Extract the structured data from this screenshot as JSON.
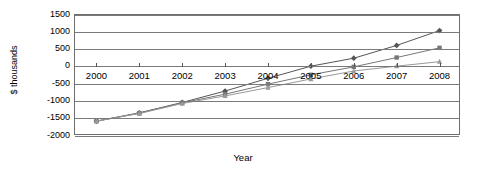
{
  "chart_data": {
    "type": "line",
    "title": "",
    "xlabel": "Year",
    "ylabel": "$ thousands",
    "categories": [
      "2000",
      "2001",
      "2002",
      "2003",
      "2004",
      "2005",
      "2006",
      "2007",
      "2008"
    ],
    "x": [
      2000,
      2001,
      2002,
      2003,
      2004,
      2005,
      2006,
      2007,
      2008
    ],
    "ylim": [
      -2000,
      1500
    ],
    "ytick_labels": [
      "1500",
      "1000",
      "500",
      "0",
      "-500",
      "-1000",
      "-1500",
      "-2000"
    ],
    "ytick_values": [
      1500,
      1000,
      500,
      0,
      -500,
      -1000,
      -1500,
      -2000
    ],
    "grid": true,
    "legend": "none",
    "series": [
      {
        "name": "Series 1",
        "marker": "diamond",
        "color": "#555555",
        "values": [
          -1570,
          -1330,
          -1030,
          -700,
          -330,
          20,
          250,
          620,
          1050
        ]
      },
      {
        "name": "Series 2",
        "marker": "square",
        "color": "#777777",
        "values": [
          -1570,
          -1340,
          -1040,
          -790,
          -500,
          -230,
          0,
          270,
          550
        ]
      },
      {
        "name": "Series 3",
        "marker": "triangle",
        "color": "#999999",
        "values": [
          -1570,
          -1350,
          -1060,
          -840,
          -600,
          -350,
          -120,
          20,
          150
        ]
      }
    ]
  },
  "axis": {
    "y_title": "$ thousands",
    "x_title": "Year"
  }
}
